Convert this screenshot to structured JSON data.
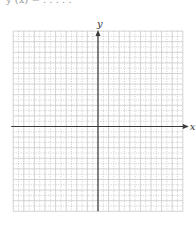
{
  "header": {
    "cropped_text": "y (x) = . . . . ."
  },
  "chart_data": {
    "type": "coordinate-grid",
    "title": "",
    "xlabel": "x",
    "ylabel": "y",
    "grid": true,
    "grid_major_spacing_px": 10.6,
    "grid_minor": "dotted half-unit lines",
    "x_units_left": 8,
    "x_units_right": 8,
    "y_units_above": 9,
    "y_units_below": 8,
    "tick_labels": [],
    "series": []
  },
  "colors": {
    "axis": "#3a3a3a",
    "grid_major": "#c8c8c8",
    "grid_minor": "#a8a8a8",
    "label": "#333333"
  },
  "labels": {
    "x_axis": "x",
    "y_axis": "y"
  }
}
